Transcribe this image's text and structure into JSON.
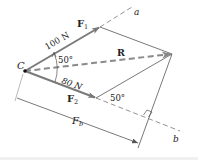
{
  "diagram": {
    "point_label": "C",
    "vectors": {
      "F1": {
        "label": "F",
        "sub": "1",
        "magnitude": "100 N"
      },
      "F2": {
        "label": "F",
        "sub": "2",
        "magnitude": "80 N"
      },
      "R": {
        "label": "R"
      }
    },
    "angles": {
      "between_F1_F2": "50°",
      "at_F2_tip": "50°"
    },
    "axes": {
      "a": "a",
      "b": "b"
    },
    "dimension": {
      "label": "F",
      "sub": "b"
    },
    "colors": {
      "vector": "#7a7a7a",
      "dashed": "#8a8a8a",
      "thin": "#555555",
      "text": "#222222"
    }
  }
}
